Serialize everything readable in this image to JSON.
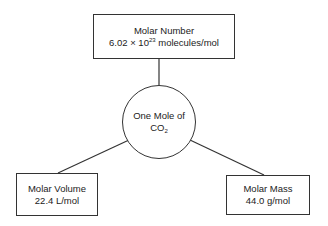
{
  "diagram": {
    "center": {
      "label_line1": "One Mole of",
      "label_line2_base": "CO",
      "label_line2_sub": "2"
    },
    "top": {
      "title": "Molar  Number",
      "value_prefix": "6.02 × 10",
      "value_exponent": "23",
      "value_suffix": " molecules/mol"
    },
    "left": {
      "title": "Molar Volume",
      "value": "22.4 L/mol"
    },
    "right": {
      "title": "Molar Mass",
      "value": "44.0 g/mol"
    }
  }
}
